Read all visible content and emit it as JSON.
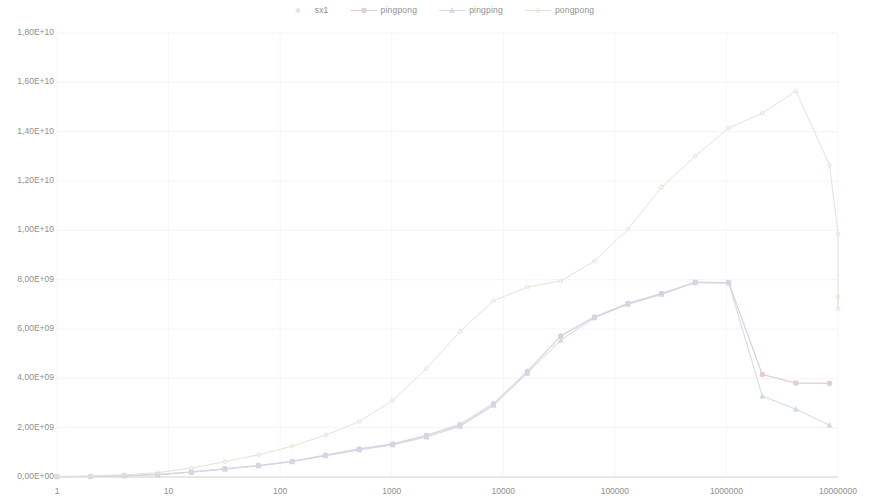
{
  "chart_data": {
    "type": "line",
    "title": "",
    "subtitle": "",
    "xlabel": "",
    "ylabel": "",
    "xscale": "log",
    "yscale": "linear",
    "xlim": [
      1,
      10000000
    ],
    "ylim": [
      0,
      18000000000
    ],
    "grid": true,
    "legend_position": "top-center",
    "y_ticks": [
      {
        "value": 18000000000,
        "label": "1,80E+10"
      },
      {
        "value": 16000000000,
        "label": "1,60E+10"
      },
      {
        "value": 14000000000,
        "label": "1,40E+10"
      },
      {
        "value": 12000000000,
        "label": "1,20E+10"
      },
      {
        "value": 10000000000,
        "label": "1,00E+10"
      },
      {
        "value": 8000000000,
        "label": "8,00E+09"
      },
      {
        "value": 6000000000,
        "label": "6,00E+09"
      },
      {
        "value": 4000000000,
        "label": "4,00E+09"
      },
      {
        "value": 2000000000,
        "label": "2,00E+09"
      },
      {
        "value": 0,
        "label": "0,00E+00"
      }
    ],
    "x_ticks": [
      {
        "value": 1,
        "label": "1"
      },
      {
        "value": 10,
        "label": "10"
      },
      {
        "value": 100,
        "label": "100"
      },
      {
        "value": 1000,
        "label": "1000"
      },
      {
        "value": 10000,
        "label": "10000"
      },
      {
        "value": 100000,
        "label": "100000"
      },
      {
        "value": 1000000,
        "label": "1000000"
      },
      {
        "value": 10000000,
        "label": "10000000"
      }
    ],
    "x": [
      1,
      2,
      4,
      8,
      16,
      32,
      64,
      128,
      256,
      512,
      1024,
      2048,
      4096,
      8192,
      16384,
      32768,
      65536,
      131072,
      262144,
      524288,
      1048576,
      2097152,
      4194304,
      8388608
    ],
    "series": [
      {
        "name": "sx1",
        "color": "#d9e4ef",
        "marker": "diamond",
        "values": [
          13000000,
          26000000,
          52000000,
          104000000,
          205000000,
          340000000,
          470000000,
          640000000,
          900000000,
          1150000000,
          1350000000,
          1700000000,
          2150000000,
          3000000000,
          4300000000,
          5750000000,
          6500000000,
          7050000000,
          7450000000,
          7880000000,
          7870000000,
          4150000000,
          3800000000,
          3790000000
        ]
      },
      {
        "name": "pingpong",
        "color": "#e3ccd6",
        "marker": "square",
        "values": [
          12000000,
          25000000,
          50000000,
          100000000,
          200000000,
          330000000,
          460000000,
          630000000,
          880000000,
          1130000000,
          1330000000,
          1680000000,
          2100000000,
          2950000000,
          4250000000,
          5700000000,
          6480000000,
          7030000000,
          7430000000,
          7900000000,
          7880000000,
          4160000000,
          3810000000,
          3800000000
        ]
      },
      {
        "name": "pingping",
        "color": "#cfd9e8",
        "marker": "triangle",
        "values": [
          11000000,
          23000000,
          47000000,
          95000000,
          190000000,
          320000000,
          450000000,
          620000000,
          860000000,
          1100000000,
          1300000000,
          1620000000,
          2050000000,
          2900000000,
          4200000000,
          5550000000,
          6450000000,
          7000000000,
          7400000000,
          7880000000,
          7860000000,
          3280000000,
          2750000000,
          2100000000
        ]
      },
      {
        "name": "pongpong",
        "color": "#e7e2d5",
        "marker": "dot",
        "values": [
          22000000,
          45000000,
          90000000,
          180000000,
          360000000,
          620000000,
          900000000,
          1250000000,
          1700000000,
          2250000000,
          3100000000,
          4400000000,
          5900000000,
          7150000000,
          7700000000,
          7950000000,
          8750000000,
          10050000000,
          11750000000,
          13000000000,
          14150000000,
          14750000000,
          15650000000,
          12650000000
        ]
      }
    ],
    "extra_points": {
      "pongpong_tail": [
        {
          "x": 16777216,
          "y": 9850000000
        },
        {
          "x": 33554432,
          "y": 6820000000
        },
        {
          "x": 67108864,
          "y": 7300000000
        }
      ]
    }
  },
  "legend": {
    "items": [
      {
        "label": "sx1",
        "marker": "diamond",
        "color": "#d9e4ef"
      },
      {
        "label": "pingpong",
        "marker": "square",
        "color": "#e3ccd6"
      },
      {
        "label": "pingping",
        "marker": "triangle",
        "color": "#cfd9e8"
      },
      {
        "label": "pongpong",
        "marker": "dot",
        "color": "#e7e2d5"
      }
    ]
  }
}
